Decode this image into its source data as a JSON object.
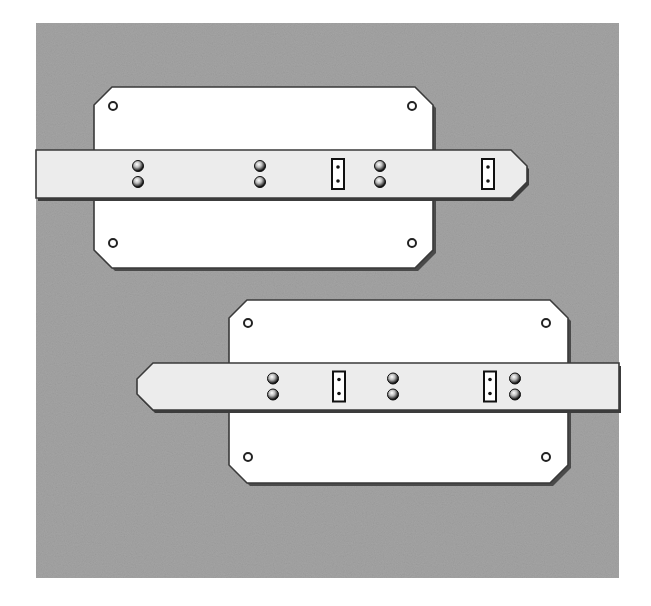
{
  "figure": {
    "colors": {
      "background": "#a4a4a4",
      "plate": "#ffffff",
      "strap": "#ececec",
      "outline": "#3a3a3a",
      "rivet": "#222222",
      "page": "#ffffff"
    },
    "panels": [
      {
        "name": "upper-assembly",
        "plate": {
          "x": 94,
          "y": 87,
          "w": 339,
          "h": 181,
          "chamfer": 18
        },
        "strap": {
          "y": 150,
          "h": 48,
          "x_start": 36,
          "x_end": 527,
          "tip": "right"
        },
        "rivet_pairs_x": [
          138,
          260,
          380
        ],
        "slots_x": [
          338,
          488
        ],
        "plate_holes": [
          [
            113,
            106
          ],
          [
            412,
            106
          ],
          [
            113,
            243
          ],
          [
            412,
            243
          ]
        ]
      },
      {
        "name": "lower-assembly",
        "plate": {
          "x": 229,
          "y": 300,
          "w": 339,
          "h": 183,
          "chamfer": 18
        },
        "strap": {
          "y": 363,
          "h": 47,
          "x_start": 137,
          "x_end": 619,
          "tip": "left"
        },
        "rivet_pairs_x": [
          273,
          393,
          515
        ],
        "slots_x": [
          339,
          490
        ],
        "plate_holes": [
          [
            248,
            323
          ],
          [
            546,
            323
          ],
          [
            248,
            457
          ],
          [
            546,
            457
          ]
        ]
      }
    ]
  }
}
